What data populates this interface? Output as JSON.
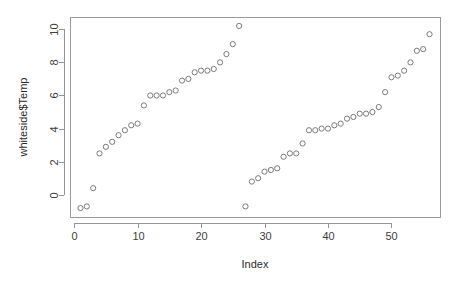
{
  "chart_data": {
    "type": "scatter",
    "title": "",
    "xlabel": "Index",
    "ylabel": "whiteside$Temp",
    "grid": false,
    "legend": "none",
    "point_symbol": "open-circle",
    "point_color": "#7b7b7b",
    "xlim": [
      -0.65,
      57.65
    ],
    "ylim": [
      -1.34,
      10.74
    ],
    "xticks": [
      0,
      10,
      20,
      30,
      40,
      50
    ],
    "xtick_labels": [
      "0",
      "10",
      "20",
      "30",
      "40",
      "50"
    ],
    "yticks": [
      0,
      2,
      4,
      6,
      8,
      10
    ],
    "ytick_labels": [
      "0",
      "2",
      "4",
      "6",
      "8",
      "10"
    ],
    "x": [
      1,
      2,
      3,
      4,
      5,
      6,
      7,
      8,
      9,
      10,
      11,
      12,
      13,
      14,
      15,
      16,
      17,
      18,
      19,
      20,
      21,
      22,
      23,
      24,
      25,
      26,
      27,
      28,
      29,
      30,
      31,
      32,
      33,
      34,
      35,
      36,
      37,
      38,
      39,
      40,
      41,
      42,
      43,
      44,
      45,
      46,
      47,
      48,
      49,
      50,
      51,
      52,
      53,
      54,
      55,
      56
    ],
    "y": [
      -0.8,
      -0.7,
      0.4,
      2.5,
      2.9,
      3.2,
      3.6,
      3.9,
      4.2,
      4.3,
      5.4,
      6.0,
      6.0,
      6.0,
      6.2,
      6.3,
      6.9,
      7.0,
      7.4,
      7.5,
      7.5,
      7.6,
      8.0,
      8.5,
      9.1,
      10.2,
      -0.7,
      0.8,
      1.0,
      1.4,
      1.5,
      1.6,
      2.3,
      2.5,
      2.5,
      3.1,
      3.9,
      3.9,
      4.0,
      4.0,
      4.2,
      4.3,
      4.6,
      4.7,
      4.9,
      4.9,
      5.0,
      5.3,
      6.2,
      7.1,
      7.2,
      7.5,
      8.0,
      8.7,
      8.8,
      9.7
    ],
    "n_points": 56,
    "series": [
      {
        "name": "whiteside$Temp",
        "x": [
          1,
          2,
          3,
          4,
          5,
          6,
          7,
          8,
          9,
          10,
          11,
          12,
          13,
          14,
          15,
          16,
          17,
          18,
          19,
          20,
          21,
          22,
          23,
          24,
          25,
          26,
          27,
          28,
          29,
          30,
          31,
          32,
          33,
          34,
          35,
          36,
          37,
          38,
          39,
          40,
          41,
          42,
          43,
          44,
          45,
          46,
          47,
          48,
          49,
          50,
          51,
          52,
          53,
          54,
          55,
          56
        ],
        "values": [
          -0.8,
          -0.7,
          0.4,
          2.5,
          2.9,
          3.2,
          3.6,
          3.9,
          4.2,
          4.3,
          5.4,
          6.0,
          6.0,
          6.0,
          6.2,
          6.3,
          6.9,
          7.0,
          7.4,
          7.5,
          7.5,
          7.6,
          8.0,
          8.5,
          9.1,
          10.2,
          -0.7,
          0.8,
          1.0,
          1.4,
          1.5,
          1.6,
          2.3,
          2.5,
          2.5,
          3.1,
          3.9,
          3.9,
          4.0,
          4.0,
          4.2,
          4.3,
          4.6,
          4.7,
          4.9,
          4.9,
          5.0,
          5.3,
          6.2,
          7.1,
          7.2,
          7.5,
          8.0,
          8.7,
          8.8,
          9.7
        ]
      }
    ]
  },
  "geometry": {
    "plot_left": 70,
    "plot_right": 440,
    "plot_top": 17,
    "plot_bottom": 217,
    "x_axis_line_y": 223,
    "y_axis_line_x": 64,
    "xlabel_x": 255,
    "xlabel_y": 268,
    "ylabel_x": 27,
    "ylabel_y": 117
  }
}
